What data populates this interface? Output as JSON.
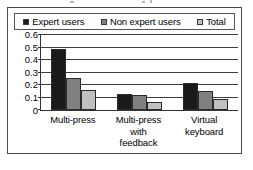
{
  "figure": {
    "frame_border_color": "#4a4a4a",
    "background": "#ffffff"
  },
  "chart_data": {
    "type": "bar",
    "title": "",
    "subtitle": "",
    "xlabel": "",
    "ylabel": "",
    "categories": [
      "Multi-press",
      "Multi-press with feedback",
      "Virtual keyboard"
    ],
    "category_lines": [
      [
        "Multi-press"
      ],
      [
        "Multi-press",
        "with",
        "feedback"
      ],
      [
        "Virtual",
        "keyboard"
      ]
    ],
    "series": [
      {
        "name": "Expert users",
        "color": "#1a1a1a",
        "values": [
          0.48,
          0.13,
          0.21
        ]
      },
      {
        "name": "Non expert users",
        "color": "#808080",
        "values": [
          0.25,
          0.12,
          0.15
        ]
      },
      {
        "name": "Total",
        "color": "#c0c0c0",
        "values": [
          0.16,
          0.06,
          0.09
        ]
      }
    ],
    "ylim": [
      0,
      0.6
    ],
    "ytick_values": [
      0,
      0.1,
      0.2,
      0.3,
      0.4,
      0.5,
      0.6
    ],
    "ytick_labels": [
      "0",
      "0.1",
      "0.2",
      "0.3",
      "0.4",
      "0.5",
      "0.6"
    ],
    "grid": true,
    "grid_axis": "y",
    "legend_position": "top",
    "legend_boxed": true
  }
}
